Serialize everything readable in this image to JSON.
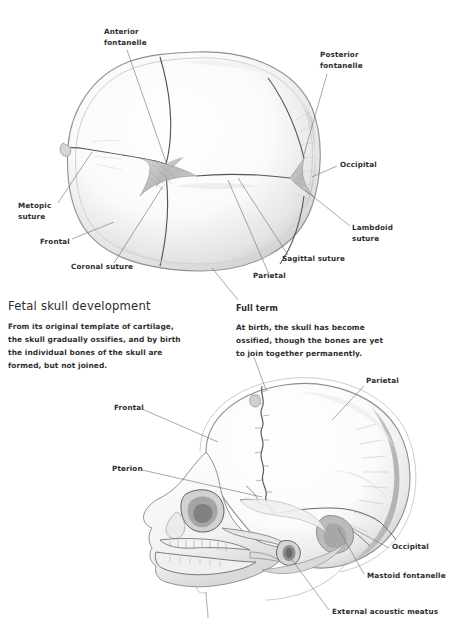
{
  "figure": {
    "title": "Fetal skull development",
    "background_color": "#ffffff",
    "ink_color": "#2e2e2e",
    "leader_color": "#6e6e6e"
  },
  "sections": {
    "left": {
      "heading": "Fetal skull development",
      "body_lines": [
        "From its original template of cartilage,",
        "the skull gradually ossifies, and by birth",
        "the individual bones of the skull are",
        "formed, but not joined."
      ]
    },
    "right": {
      "heading": "Full term",
      "body_lines": [
        "At birth, the skull has become",
        "ossified, though the bones are yet",
        "to join together permanently."
      ]
    }
  },
  "figures": [
    {
      "name": "superior-view-fetal-skull",
      "view": "superior (top-down) view of full-term fetal skull",
      "labels": [
        {
          "id": "anterior-fontanelle",
          "text": "Anterior\nfontanelle",
          "x": 104,
          "y": 31,
          "align": "left"
        },
        {
          "id": "posterior-fontanelle",
          "text": "Posterior\nfontanelle",
          "x": 320,
          "y": 54,
          "align": "left"
        },
        {
          "id": "occipital-top",
          "text": "Occipital",
          "x": 340,
          "y": 163,
          "align": "left"
        },
        {
          "id": "metopic-suture",
          "text": "Metopic\nsuture",
          "x": 18,
          "y": 204,
          "align": "left"
        },
        {
          "id": "lambdoid-suture",
          "text": "Lambdoid\nsuture",
          "x": 352,
          "y": 226,
          "align": "left"
        },
        {
          "id": "frontal-top",
          "text": "Frontal",
          "x": 40,
          "y": 240,
          "align": "left"
        },
        {
          "id": "sagittal-suture",
          "text": "Sagittal suture",
          "x": 282,
          "y": 257,
          "align": "left"
        },
        {
          "id": "coronal-suture",
          "text": "Coronal suture",
          "x": 71,
          "y": 265,
          "align": "left"
        },
        {
          "id": "parietal-top",
          "text": "Parietal",
          "x": 253,
          "y": 274,
          "align": "left"
        }
      ]
    },
    {
      "name": "lateral-view-fetal-skull",
      "view": "lateral (side) view of full-term fetal skull",
      "labels": [
        {
          "id": "parietal-lateral",
          "text": "Parietal",
          "x": 366,
          "y": 379,
          "align": "left"
        },
        {
          "id": "frontal-lateral",
          "text": "Frontal",
          "x": 114,
          "y": 406,
          "align": "left"
        },
        {
          "id": "pterion",
          "text": "Pterion",
          "x": 112,
          "y": 467,
          "align": "left"
        },
        {
          "id": "occipital-lateral",
          "text": "Occipital",
          "x": 392,
          "y": 545,
          "align": "left"
        },
        {
          "id": "mastoid-fontanelle",
          "text": "Mastoid fontanelle",
          "x": 367,
          "y": 574,
          "align": "left"
        },
        {
          "id": "external-acoustic-meatus",
          "text": "External acoustic meatus",
          "x": 332,
          "y": 610,
          "align": "left"
        }
      ]
    }
  ],
  "callouts": [
    {
      "id": "full-term-callout",
      "text": "Full term"
    }
  ]
}
